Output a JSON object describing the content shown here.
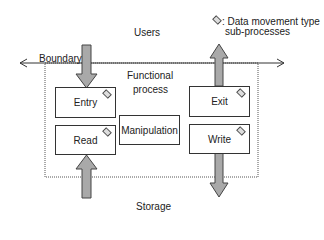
{
  "diagram": {
    "legend": {
      "symbol": "diamond",
      "line1": ": Data movement type",
      "line2": "sub-processes"
    },
    "users_label": "Users",
    "storage_label": "Storage",
    "boundary_label": "Boundary",
    "functional_process_line1": "Functional",
    "functional_process_line2": "process",
    "boxes": {
      "entry": "Entry",
      "read": "Read",
      "manipulation": "Manipulation",
      "exit": "Exit",
      "write": "Write"
    },
    "colors": {
      "arrow_fill": "#a9a9a9",
      "line": "#333333"
    }
  }
}
